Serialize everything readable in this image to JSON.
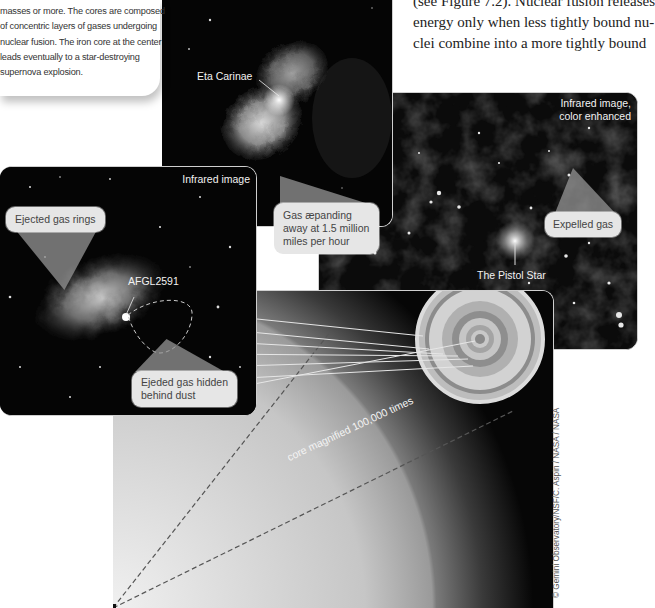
{
  "caption": {
    "lines": [
      "masses or more. The cores are composed",
      "of concentric layers of gases undergoing",
      "nuclear fusion. The iron core at the center",
      "leads eventually to a star-destroying",
      "supernova explosion."
    ]
  },
  "body_text": {
    "lines": [
      "(see Figure 7.2). Nuclear fusion releases",
      "energy only when less tightly bound nu-",
      "clei combine into a more tightly bound"
    ]
  },
  "panels": {
    "eta_carinae": {
      "label": "Eta Carinae",
      "callout": [
        "Gas æpanding",
        "away at 1.5 million",
        "miles per hour"
      ]
    },
    "pistol_star": {
      "image_note": [
        "Infrared image,",
        "color enhanced"
      ],
      "label": "The Pistol Star",
      "callout": "Expelled gas"
    },
    "afgl2591": {
      "image_note": "Infrared image",
      "label": "AFGL2591",
      "callout_top": "Ejected gas rings",
      "callout_bottom": [
        "Ejeded gas hidden",
        "behind dust"
      ]
    },
    "core": {
      "shells": [
        "H fusion shell",
        "He fusion shell",
        "C fusion shell",
        "Ne fusion shell",
        "O fusion shell",
        "Si fusion shell",
        "Iron core"
      ],
      "magnification_label": "core magnified 100,000 times"
    }
  },
  "credit": "© Gemini Observatory/NSF/C. Aspin / NASA / NASA"
}
